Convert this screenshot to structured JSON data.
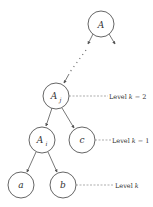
{
  "diagram": {
    "type": "tree",
    "nodes": [
      {
        "id": "A",
        "label": "A",
        "subscript": ""
      },
      {
        "id": "Aj",
        "label": "A",
        "subscript": "j"
      },
      {
        "id": "Ai",
        "label": "A",
        "subscript": "i"
      },
      {
        "id": "c",
        "label": "c",
        "subscript": ""
      },
      {
        "id": "a",
        "label": "a",
        "subscript": ""
      },
      {
        "id": "b",
        "label": "b",
        "subscript": ""
      }
    ],
    "edges": [
      {
        "from": "A",
        "to": "Aj",
        "style": "dotted-path"
      },
      {
        "from": "A",
        "to": "right-offscreen",
        "style": "solid"
      },
      {
        "from": "Aj",
        "to": "Ai",
        "style": "solid"
      },
      {
        "from": "Aj",
        "to": "c",
        "style": "solid"
      },
      {
        "from": "Ai",
        "to": "a",
        "style": "solid"
      },
      {
        "from": "Ai",
        "to": "b",
        "style": "solid"
      }
    ],
    "levels": [
      {
        "node": "Aj",
        "prefix": "Level ",
        "var": "k",
        "suffix": " − 2"
      },
      {
        "node": "c",
        "prefix": "Level ",
        "var": "k",
        "suffix": " − 1"
      },
      {
        "node": "b",
        "prefix": "Level ",
        "var": "k",
        "suffix": ""
      }
    ]
  }
}
